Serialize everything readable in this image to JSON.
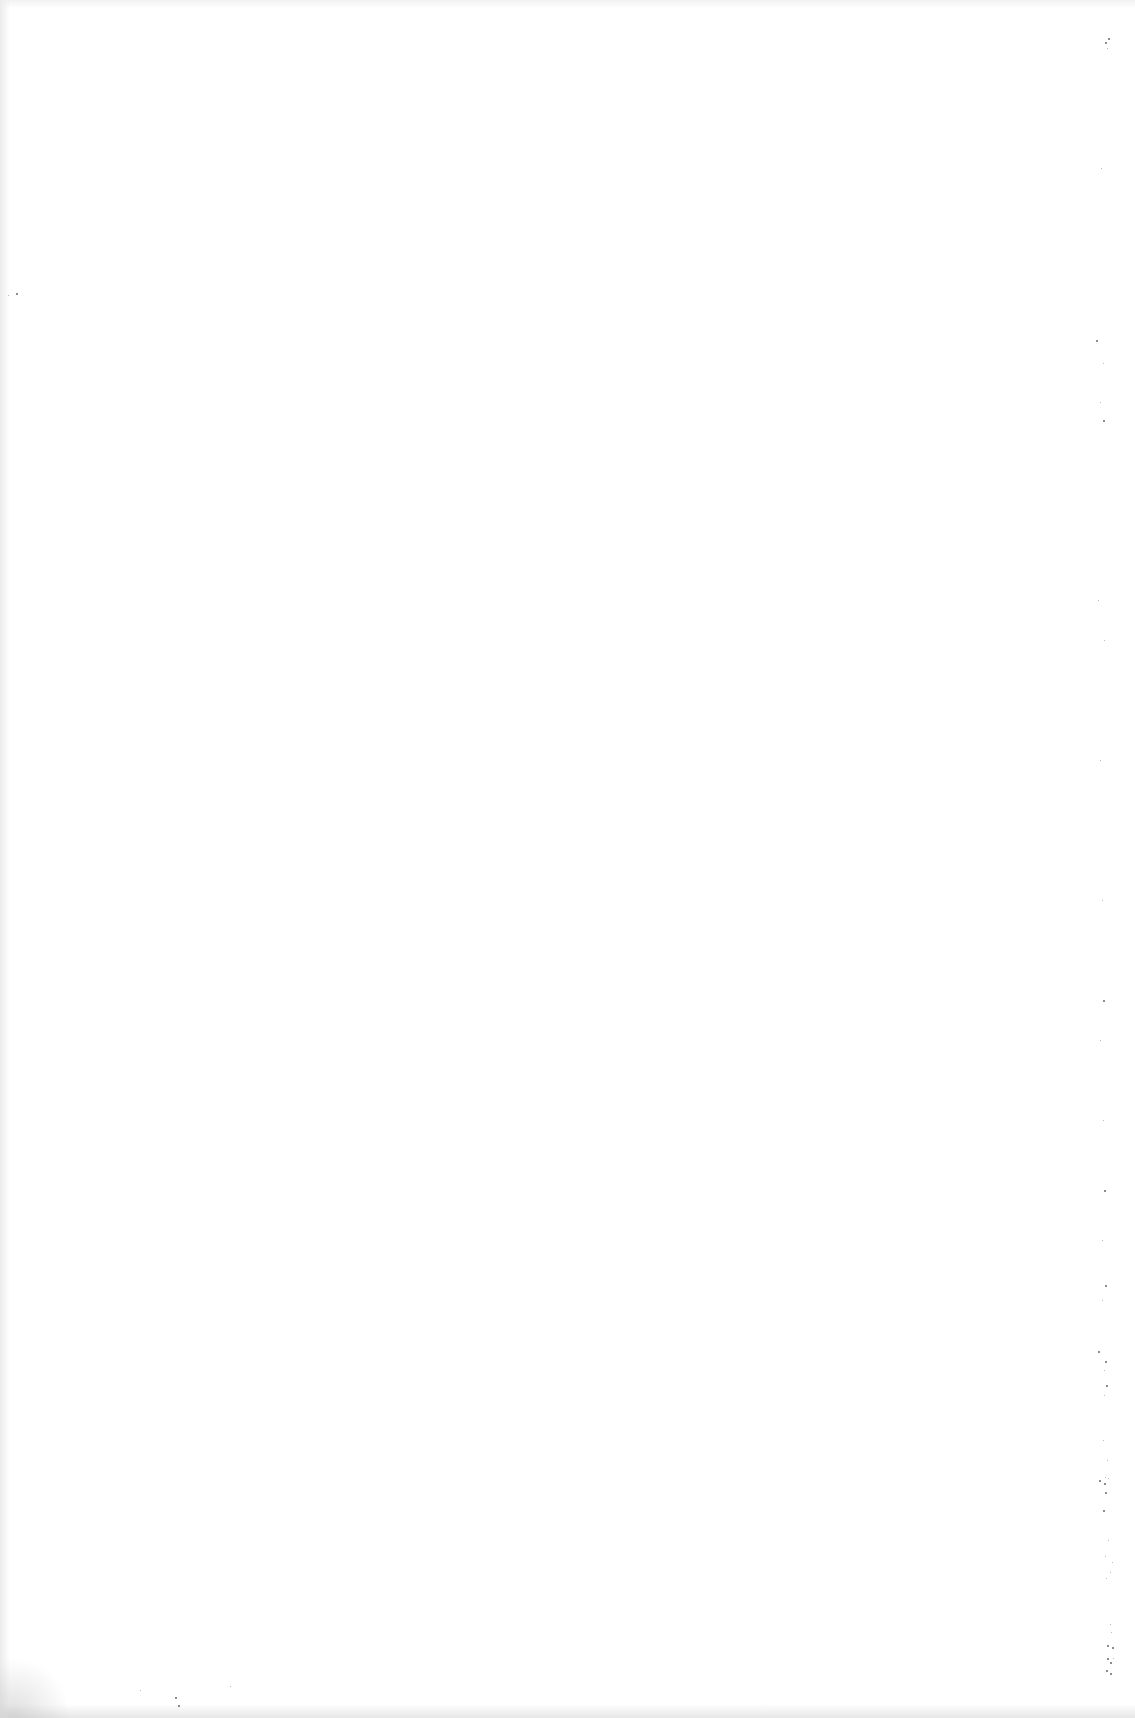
{
  "document": {
    "type": "blank scanned page",
    "text": ""
  },
  "colors": {
    "paper": "#ffffff",
    "speckle": "#333333"
  },
  "specks": [
    [
      1105,
      42,
      2
    ],
    [
      1108,
      38,
      2
    ],
    [
      1107,
      48,
      1
    ],
    [
      8,
      295,
      1
    ],
    [
      16,
      293,
      2
    ],
    [
      1101,
      168,
      1
    ],
    [
      1096,
      340,
      2
    ],
    [
      1103,
      363,
      1
    ],
    [
      1100,
      402,
      1
    ],
    [
      1103,
      420,
      2
    ],
    [
      1098,
      600,
      1
    ],
    [
      1104,
      640,
      1
    ],
    [
      1100,
      760,
      1
    ],
    [
      1102,
      900,
      1
    ],
    [
      1103,
      1000,
      2
    ],
    [
      1100,
      1040,
      1
    ],
    [
      1103,
      1120,
      1
    ],
    [
      1104,
      1190,
      2
    ],
    [
      1102,
      1240,
      1
    ],
    [
      1105,
      1285,
      2
    ],
    [
      1102,
      1300,
      1
    ],
    [
      1098,
      1351,
      2
    ],
    [
      1105,
      1361,
      2
    ],
    [
      1104,
      1370,
      1
    ],
    [
      1106,
      1385,
      2
    ],
    [
      1104,
      1395,
      1
    ],
    [
      1103,
      1440,
      1
    ],
    [
      1107,
      1460,
      1
    ],
    [
      1105,
      1477,
      1
    ],
    [
      1099,
      1480,
      2
    ],
    [
      1104,
      1483,
      2
    ],
    [
      1108,
      1478,
      1
    ],
    [
      1105,
      1492,
      2
    ],
    [
      1103,
      1510,
      2
    ],
    [
      1108,
      1540,
      1
    ],
    [
      1105,
      1556,
      1
    ],
    [
      1106,
      1578,
      1
    ],
    [
      1112,
      1562,
      1
    ],
    [
      1110,
      1572,
      1
    ],
    [
      1110,
      1624,
      1
    ],
    [
      1111,
      1632,
      1
    ],
    [
      1107,
      1645,
      2
    ],
    [
      1112,
      1647,
      2
    ],
    [
      1107,
      1658,
      2
    ],
    [
      1110,
      1662,
      2
    ],
    [
      1113,
      1658,
      1
    ],
    [
      1106,
      1670,
      2
    ],
    [
      1110,
      1673,
      2
    ],
    [
      230,
      1686,
      1
    ],
    [
      175,
      1697,
      2
    ],
    [
      178,
      1705,
      2
    ],
    [
      140,
      1690,
      1
    ]
  ]
}
